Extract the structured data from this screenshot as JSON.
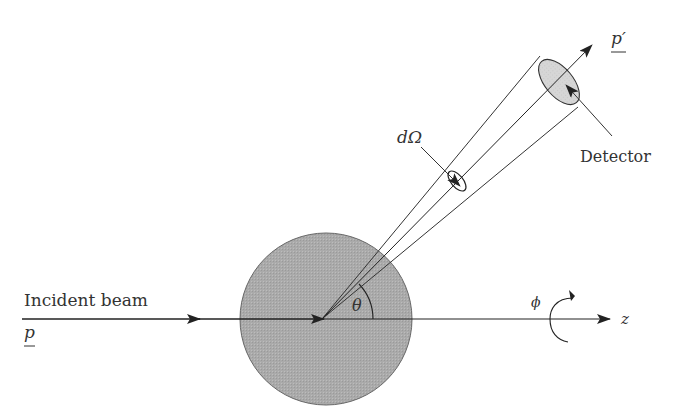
{
  "diagram": {
    "type": "scattering-geometry",
    "labels": {
      "incident_beam": "Incident beam",
      "incident_momentum": "p",
      "outgoing_momentum": "p′",
      "detector": "Detector",
      "solid_angle": "dΩ",
      "scattering_angle": "θ",
      "azimuthal_angle": "ϕ",
      "axis": "z"
    },
    "colors": {
      "line": "#222222",
      "target_fill": "#a8a8a8",
      "detector_fill": "#d4d4d4",
      "text": "#333333"
    }
  }
}
